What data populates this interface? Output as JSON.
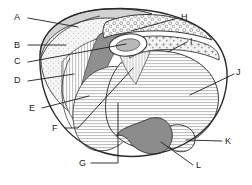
{
  "figure": {
    "type": "line-drawing",
    "background_color": "#ffffff",
    "stroke_color": "#2b2b2b",
    "fills": {
      "light_gray": "#d3d3d3",
      "mid_gray": "#9a9a9a",
      "dark_gray": "#8a8a8a",
      "pale": "#efefef",
      "white": "#ffffff"
    }
  },
  "labels": [
    {
      "id": "A",
      "text": "A",
      "x": 18,
      "y": 17,
      "side": "left",
      "region": "outer-light-gray-cap"
    },
    {
      "id": "B",
      "text": "B",
      "x": 18,
      "y": 45,
      "side": "left",
      "region": "stippled-zone"
    },
    {
      "id": "C",
      "text": "C",
      "x": 18,
      "y": 61,
      "side": "left",
      "region": "central-oval-cavity"
    },
    {
      "id": "D",
      "text": "D",
      "x": 18,
      "y": 80,
      "side": "left",
      "region": "vertical-striped-zone"
    },
    {
      "id": "E",
      "text": "E",
      "x": 32,
      "y": 108,
      "side": "left",
      "region": "dark-gray-band"
    },
    {
      "id": "F",
      "text": "F",
      "x": 55,
      "y": 129,
      "side": "left",
      "region": "vertical-hatched-wedge"
    },
    {
      "id": "G",
      "text": "G",
      "x": 81,
      "y": 165,
      "side": "below",
      "region": "horizontal-striped-lower"
    },
    {
      "id": "H",
      "text": "H",
      "x": 182,
      "y": 17,
      "side": "right",
      "region": "circles-bubble-band"
    },
    {
      "id": "I",
      "text": "I",
      "x": 190,
      "y": 41,
      "side": "right",
      "region": "cross-stipple-band"
    },
    {
      "id": "J",
      "text": "J",
      "x": 238,
      "y": 72,
      "side": "right",
      "region": "horizontal-striped-main"
    },
    {
      "id": "K",
      "text": "K",
      "x": 226,
      "y": 141,
      "side": "right",
      "region": "small-lobe"
    },
    {
      "id": "L",
      "text": "L",
      "x": 197,
      "y": 166,
      "side": "right",
      "region": "dark-gray-lobe"
    }
  ],
  "leaders": [
    {
      "for": "A",
      "points": "28,18 78,27"
    },
    {
      "for": "B",
      "points": "28,45 66,45"
    },
    {
      "for": "C",
      "points": "28,62 126,44"
    },
    {
      "for": "D",
      "points": "28,81 74,74"
    },
    {
      "for": "E",
      "points": "42,108 89,96"
    },
    {
      "for": "F",
      "points": "65,128 78,128 133,68"
    },
    {
      "for": "G",
      "points": "91,163 118,163 118,103"
    },
    {
      "for": "H",
      "points": "178,18 131,31"
    },
    {
      "for": "I",
      "points": "187,42 168,52"
    },
    {
      "for": "J",
      "points": "234,74 190,95"
    },
    {
      "for": "K",
      "points": "222,141 186,140"
    },
    {
      "for": "L",
      "points": "193,165 161,142"
    }
  ]
}
